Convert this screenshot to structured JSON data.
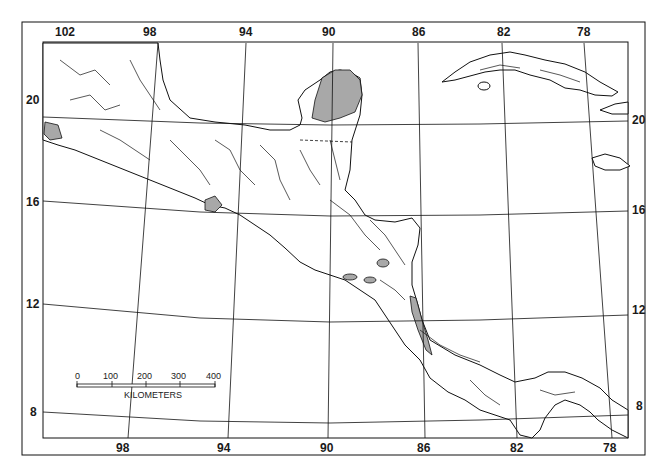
{
  "map": {
    "type": "reference map",
    "region": "Mexico, Central America and Caribbean",
    "colors": {
      "land": "#ffffff",
      "shaded": "#a8a8a8",
      "line": "#111111",
      "background": "#ffffff"
    },
    "longitude_labels_top": [
      "102",
      "98",
      "94",
      "90",
      "86",
      "82",
      "78"
    ],
    "longitude_labels_bottom": [
      "98",
      "94",
      "90",
      "86",
      "82",
      "78"
    ],
    "latitude_labels_left": [
      "20",
      "16",
      "12",
      "8"
    ],
    "latitude_labels_right": [
      "20",
      "16",
      "12",
      "8"
    ],
    "scale_bar": {
      "ticks": [
        "0",
        "100",
        "200",
        "300",
        "400"
      ],
      "unit": "KILOMETERS"
    }
  }
}
